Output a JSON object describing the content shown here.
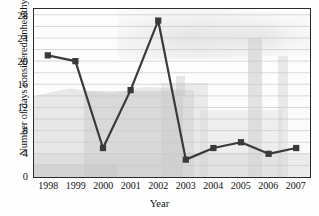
{
  "chart_data": {
    "type": "line",
    "title": "",
    "xlabel": "Year",
    "ylabel": "Number of days considered unhealthy",
    "categories": [
      "1998",
      "1999",
      "2000",
      "2001",
      "2002",
      "2003",
      "2004",
      "2005",
      "2006",
      "2007"
    ],
    "values": [
      21,
      20,
      5,
      15,
      27,
      3,
      5,
      6,
      4,
      5
    ],
    "ylim": [
      0,
      29
    ],
    "ytick_labels": [
      "0",
      "4",
      "8",
      "12",
      "16",
      "20",
      "24",
      "28"
    ],
    "ytick_values": [
      0,
      4,
      8,
      12,
      16,
      20,
      24,
      28
    ],
    "gridline_values": [
      2,
      4,
      6,
      8,
      10,
      12,
      14,
      16,
      18,
      20,
      22,
      24,
      26,
      28
    ],
    "grid": true,
    "legend": "none",
    "marker": "square",
    "series_color": "#3a3a3a",
    "grid_color": "#c9c9c9",
    "axis_color": "#2b2b2b",
    "background_image": "industrial-smokestack-photo-faded"
  }
}
